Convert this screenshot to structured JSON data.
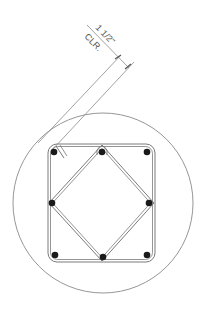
{
  "drawing": {
    "type": "circular column section with square tie and diamond cross-tie",
    "dimension": {
      "value_label": "1 1/2\"",
      "note_label": "CLR."
    },
    "colors": {
      "line": "#8a8a8a",
      "tie": "#7a7a7a",
      "bar": "#1a1a1a",
      "text": "#555555",
      "background": "#ffffff"
    },
    "circle": {
      "cx": 103,
      "cy": 203,
      "r": 90
    },
    "tie_rect": {
      "x": 48,
      "y": 144,
      "width": 107,
      "height": 118,
      "corner_radius": 9
    },
    "diamond_tie": {
      "points": [
        [
          102,
          147
        ],
        [
          152,
          203
        ],
        [
          102,
          259
        ],
        [
          51,
          203
        ]
      ]
    },
    "bars": [
      {
        "name": "bar-top-left",
        "cx": 53,
        "cy": 152
      },
      {
        "name": "bar-top-middle",
        "cx": 102,
        "cy": 152
      },
      {
        "name": "bar-top-right",
        "cx": 147,
        "cy": 152
      },
      {
        "name": "bar-middle-left",
        "cx": 53,
        "cy": 203
      },
      {
        "name": "bar-middle-right",
        "cx": 148,
        "cy": 203
      },
      {
        "name": "bar-bottom-left",
        "cx": 54,
        "cy": 255
      },
      {
        "name": "bar-bottom-middle",
        "cx": 102,
        "cy": 257
      },
      {
        "name": "bar-bottom-right",
        "cx": 146,
        "cy": 255
      }
    ]
  }
}
